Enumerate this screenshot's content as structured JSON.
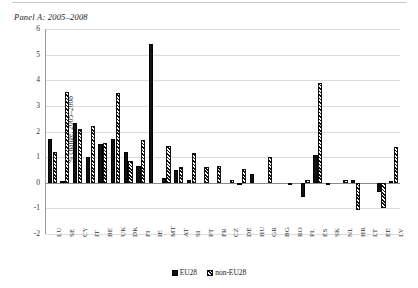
{
  "panel": {
    "title": "Panel A: 2005–2008"
  },
  "chart_data": {
    "type": "bar",
    "title": "Panel A: 2005–2008",
    "xlabel": "",
    "ylabel": "% change, 2005–2008",
    "ylim": [
      -2,
      6
    ],
    "yticks": [
      6,
      5,
      4,
      3,
      2,
      1,
      0,
      -1,
      -2
    ],
    "ytick_labels": [
      "6",
      "5",
      "4",
      "3",
      "2",
      "1",
      "0",
      "-1",
      "-2"
    ],
    "grid": true,
    "legend_position": "bottom",
    "categories": [
      "LU",
      "SE",
      "CY",
      "IT",
      "BE",
      "UK",
      "DK",
      "FI",
      "IE",
      "MT",
      "AT",
      "SI",
      "PT",
      "FR",
      "CZ",
      "DE",
      "HU",
      "GR",
      "BG",
      "RO",
      "PL",
      "ES",
      "SK",
      "NL",
      "HR",
      "LT",
      "EE",
      "LV"
    ],
    "series": [
      {
        "name": "EU28",
        "values": [
          1.7,
          0.05,
          2.35,
          1.0,
          1.5,
          1.7,
          1.2,
          0.65,
          5.4,
          0.18,
          0.5,
          0.1,
          0.0,
          0.0,
          0.0,
          -0.1,
          0.35,
          0.0,
          0.0,
          -0.05,
          -0.55,
          1.1,
          -0.05,
          0.0,
          0.1,
          0.0,
          -0.35,
          0.05
        ]
      },
      {
        "name": "non-EU28",
        "values": [
          1.2,
          3.55,
          2.1,
          2.2,
          1.55,
          3.5,
          0.85,
          1.65,
          0.0,
          1.45,
          0.6,
          1.15,
          0.6,
          0.65,
          0.12,
          0.55,
          0.0,
          1.0,
          0.0,
          0.0,
          0.1,
          3.9,
          0.0,
          0.1,
          -1.05,
          0.0,
          -1.0,
          1.4
        ]
      }
    ]
  },
  "legend": {
    "items": [
      {
        "label": "EU28",
        "pattern": "solid",
        "color": "#111111"
      },
      {
        "label": "non-EU28",
        "pattern": "hatched",
        "color": "#111111"
      }
    ]
  }
}
